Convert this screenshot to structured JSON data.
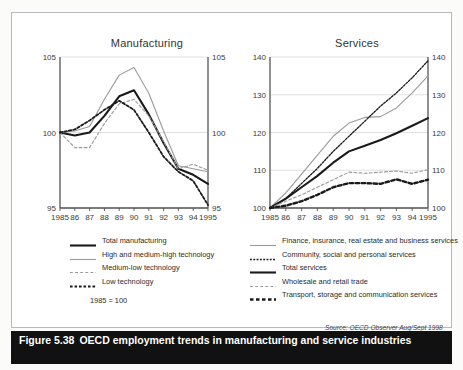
{
  "caption": {
    "figure_number": "Figure 5.38",
    "text": "OECD employment trends in manufacturing and service industries"
  },
  "note": "1985 = 100",
  "source": "Source: OECD Observer Aug/Sept 1998",
  "colors": {
    "black": "#1a1a1a",
    "grey": "#9a9a9a",
    "axis": "#555555",
    "gridline": "#d8d8d8",
    "caption_bg": "#111111",
    "caption_fg": "#ffffff"
  },
  "chart_data": [
    {
      "type": "line",
      "title": "Manufacturing",
      "xlabel": "",
      "ylabel": "",
      "xlim": [
        1985,
        1995
      ],
      "ylim": [
        95,
        105
      ],
      "yticks": [
        95,
        100,
        105
      ],
      "xticks": [
        1985,
        1986,
        1987,
        1988,
        1989,
        1990,
        1991,
        1992,
        1993,
        1994,
        1995
      ],
      "xticklabels": [
        "1985",
        "86",
        "87",
        "88",
        "89",
        "90",
        "91",
        "92",
        "93",
        "94",
        "1995"
      ],
      "grid": true,
      "dual_y_axis": true,
      "legend_position": "below",
      "annotation": "1985 = 100",
      "x": [
        1985,
        1986,
        1987,
        1988,
        1989,
        1990,
        1991,
        1992,
        1993,
        1994,
        1995
      ],
      "series": [
        {
          "name": "Total manufacturing",
          "style": "solid",
          "color": "#1a1a1a",
          "width": 2.1,
          "values": [
            100.0,
            99.8,
            100.0,
            101.1,
            102.4,
            102.8,
            101.2,
            99.3,
            97.6,
            97.2,
            96.6
          ]
        },
        {
          "name": "High and medium-high technology",
          "style": "solid",
          "color": "#9a9a9a",
          "width": 1.1,
          "values": [
            100.0,
            100.1,
            100.4,
            102.2,
            103.8,
            104.3,
            102.6,
            100.1,
            97.8,
            97.6,
            97.4
          ]
        },
        {
          "name": "Medium-low technology",
          "style": "dashed",
          "color": "#9a9a9a",
          "width": 1.1,
          "values": [
            100.0,
            99.0,
            99.0,
            100.6,
            101.9,
            102.2,
            101.1,
            99.4,
            97.6,
            97.9,
            97.5
          ]
        },
        {
          "name": "Low technology",
          "style": "dotted",
          "color": "#1a1a1a",
          "width": 1.8,
          "values": [
            100.0,
            100.2,
            100.8,
            101.5,
            102.1,
            101.5,
            100.0,
            98.4,
            97.4,
            96.8,
            95.2
          ]
        }
      ]
    },
    {
      "type": "line",
      "title": "Services",
      "xlabel": "",
      "ylabel": "",
      "xlim": [
        1985,
        1995
      ],
      "ylim": [
        100,
        140
      ],
      "yticks": [
        100,
        110,
        120,
        130,
        140
      ],
      "xticks": [
        1985,
        1986,
        1987,
        1988,
        1989,
        1990,
        1991,
        1992,
        1993,
        1994,
        1995
      ],
      "xticklabels": [
        "1985",
        "86",
        "87",
        "88",
        "89",
        "90",
        "91",
        "92",
        "93",
        "94",
        "1995"
      ],
      "grid": true,
      "dual_y_axis": true,
      "legend_position": "below",
      "x": [
        1985,
        1986,
        1987,
        1988,
        1989,
        1990,
        1991,
        1992,
        1993,
        1994,
        1995
      ],
      "series": [
        {
          "name": "Finance, insurance, real estate and business services",
          "style": "solid",
          "color": "#9a9a9a",
          "width": 1.1,
          "values": [
            100.0,
            104.0,
            109.0,
            114.0,
            119.0,
            122.5,
            124.0,
            124.2,
            126.5,
            130.5,
            135.0
          ]
        },
        {
          "name": "Community, social and personal services",
          "style": "dotted",
          "color": "#1a1a1a",
          "width": 1.3,
          "values": [
            100.0,
            102.5,
            106.5,
            110.5,
            115.0,
            119.0,
            123.0,
            127.0,
            130.5,
            134.5,
            139.0
          ]
        },
        {
          "name": "Total services",
          "style": "solid",
          "color": "#1a1a1a",
          "width": 2.1,
          "values": [
            100.0,
            102.5,
            105.5,
            108.5,
            112.0,
            115.0,
            116.5,
            118.0,
            119.8,
            121.8,
            123.8
          ]
        },
        {
          "name": "Wholesale and retail trade",
          "style": "dashed",
          "color": "#9a9a9a",
          "width": 1.1,
          "values": [
            100.0,
            101.8,
            103.5,
            105.5,
            107.5,
            109.5,
            109.2,
            109.5,
            109.8,
            109.2,
            110.2
          ]
        },
        {
          "name": "Transport, storage and communication services",
          "style": "dotted",
          "color": "#1a1a1a",
          "width": 2.4,
          "values": [
            100.0,
            100.6,
            101.8,
            103.5,
            105.5,
            106.6,
            106.6,
            106.4,
            107.6,
            106.4,
            107.5
          ]
        }
      ]
    }
  ],
  "legends": {
    "left": [
      {
        "label": "Total manufacturing",
        "style": "solid",
        "color": "#1a1a1a",
        "width": 2.1
      },
      {
        "label": "High and medium-high technology",
        "style": "solid",
        "color": "#9a9a9a",
        "width": 1.1
      },
      {
        "label": "Medium-low technology",
        "style": "dashed",
        "color": "#9a9a9a",
        "width": 1.1
      },
      {
        "label": "Low technology",
        "style": "dotted",
        "color": "#1a1a1a",
        "width": 1.8
      }
    ],
    "right": [
      {
        "label": "Finance, insurance, real estate and business services",
        "style": "solid",
        "color": "#9a9a9a",
        "width": 1.1
      },
      {
        "label": "Community, social and personal services",
        "style": "dotted",
        "color": "#1a1a1a",
        "width": 1.3
      },
      {
        "label": "Total services",
        "style": "solid",
        "color": "#1a1a1a",
        "width": 2.1
      },
      {
        "label": "Wholesale and retail trade",
        "style": "dashed",
        "color": "#9a9a9a",
        "width": 1.1
      },
      {
        "label": "Transport, storage and communication services",
        "style": "dotted",
        "color": "#1a1a1a",
        "width": 2.4
      }
    ]
  }
}
